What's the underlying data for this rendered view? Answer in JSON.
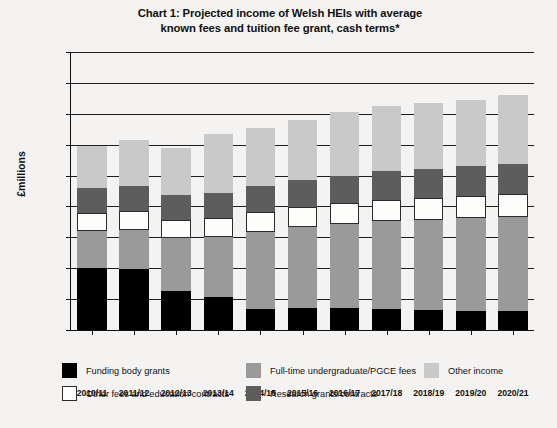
{
  "chart_data": {
    "type": "bar",
    "stacked": true,
    "title": "Chart 1: Projected income of Welsh HEIs with average known fees and tuition fee grant, cash terms*",
    "title_lines": [
      "Chart 1: Projected income of Welsh HEIs with average",
      "known fees and tuition fee grant, cash terms*"
    ],
    "xlabel": "",
    "ylabel": "£millions",
    "ylim": [
      0,
      1800
    ],
    "ytick_step": 200,
    "ytick_labels": [
      "0",
      "200",
      "400",
      "600",
      "800",
      "1,000",
      "1,200",
      "1,400",
      "1,600",
      "1,800"
    ],
    "ytick_values": [
      0,
      200,
      400,
      600,
      800,
      1000,
      1200,
      1400,
      1600,
      1800
    ],
    "grid": true,
    "grid_axis": "y",
    "legend_position": "bottom",
    "categories": [
      "2010/11",
      "2011/12",
      "2012/13",
      "2013/14",
      "2014/15",
      "2015/16",
      "2016/17",
      "2017/18",
      "2018/19",
      "2019/20",
      "2020/21"
    ],
    "series": [
      {
        "name": "Funding body grants",
        "color": "#000000",
        "values": [
          400,
          395,
          255,
          215,
          135,
          145,
          140,
          135,
          130,
          125,
          120
        ]
      },
      {
        "name": "Full-time undergraduate/PGCE fees",
        "color": "#9a9a9a",
        "values": [
          240,
          255,
          340,
          385,
          500,
          520,
          545,
          570,
          585,
          600,
          615
        ]
      },
      {
        "name": "Other fees and education contracts",
        "color": "#ffffff",
        "values": [
          120,
          120,
          120,
          125,
          130,
          130,
          135,
          140,
          140,
          145,
          145
        ]
      },
      {
        "name": "Research grants/contracts",
        "color": "#5d5d5d",
        "values": [
          160,
          160,
          160,
          165,
          170,
          175,
          180,
          185,
          190,
          190,
          195
        ]
      },
      {
        "name": "Other income",
        "color": "#c9c9c9",
        "values": [
          270,
          300,
          305,
          380,
          375,
          390,
          410,
          420,
          425,
          430,
          445
        ]
      }
    ],
    "totals": [
      1190,
      1230,
      1180,
      1270,
      1310,
      1360,
      1410,
      1450,
      1470,
      1490,
      1520
    ]
  }
}
